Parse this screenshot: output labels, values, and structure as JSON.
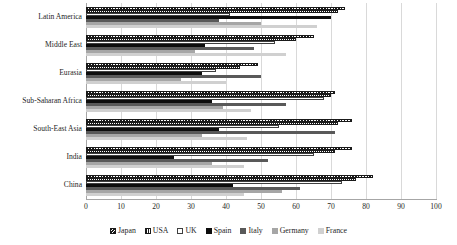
{
  "chart_data": {
    "type": "bar",
    "orientation": "horizontal",
    "title": "",
    "xlabel": "",
    "ylabel": "",
    "xlim": [
      0,
      100
    ],
    "xticks": [
      0,
      10,
      20,
      30,
      40,
      50,
      60,
      70,
      80,
      90,
      100
    ],
    "grid": true,
    "legend_position": "bottom",
    "categories": [
      "Latin America",
      "Middle East",
      "Eurasia",
      "Sub-Saharan Africa",
      "South-East Asia",
      "India",
      "China"
    ],
    "series": [
      {
        "name": "Japan",
        "color": "#1a1a1a",
        "pattern": "diagonal-hatch",
        "values": [
          74,
          65,
          49,
          71,
          76,
          76,
          82
        ]
      },
      {
        "name": "USA",
        "color": "#1a1a1a",
        "pattern": "horizontal-hatch",
        "values": [
          72,
          60,
          44,
          70,
          72,
          71,
          77
        ]
      },
      {
        "name": "UK",
        "color": "#3f3f3f",
        "pattern": "outline",
        "values": [
          41,
          54,
          37,
          68,
          55,
          65,
          73
        ]
      },
      {
        "name": "Spain",
        "color": "#0d0d0d",
        "pattern": "solid-black",
        "values": [
          70,
          34,
          33,
          36,
          38,
          25,
          42
        ]
      },
      {
        "name": "Italy",
        "color": "#595959",
        "pattern": "solid-dark-gray",
        "values": [
          38,
          48,
          50,
          57,
          71,
          52,
          61
        ]
      },
      {
        "name": "Germany",
        "color": "#a6a6a6",
        "pattern": "solid-light-gray",
        "values": [
          50,
          31,
          27,
          39,
          33,
          36,
          56
        ]
      },
      {
        "name": "France",
        "color": "#d0d0d0",
        "pattern": "solid-pale-gray",
        "values": [
          66,
          57,
          40,
          47,
          46,
          45,
          45
        ]
      }
    ]
  },
  "axis": {
    "tick_labels": [
      "0",
      "10",
      "20",
      "30",
      "40",
      "50",
      "60",
      "70",
      "80",
      "90",
      "100"
    ]
  },
  "legend": {
    "items": [
      {
        "label": "Japan",
        "series_index": 0
      },
      {
        "label": "USA",
        "series_index": 1
      },
      {
        "label": "UK",
        "series_index": 2
      },
      {
        "label": "Spain",
        "series_index": 3
      },
      {
        "label": "Italy",
        "series_index": 4
      },
      {
        "label": "Germany",
        "series_index": 5
      },
      {
        "label": "France",
        "series_index": 6
      }
    ]
  }
}
